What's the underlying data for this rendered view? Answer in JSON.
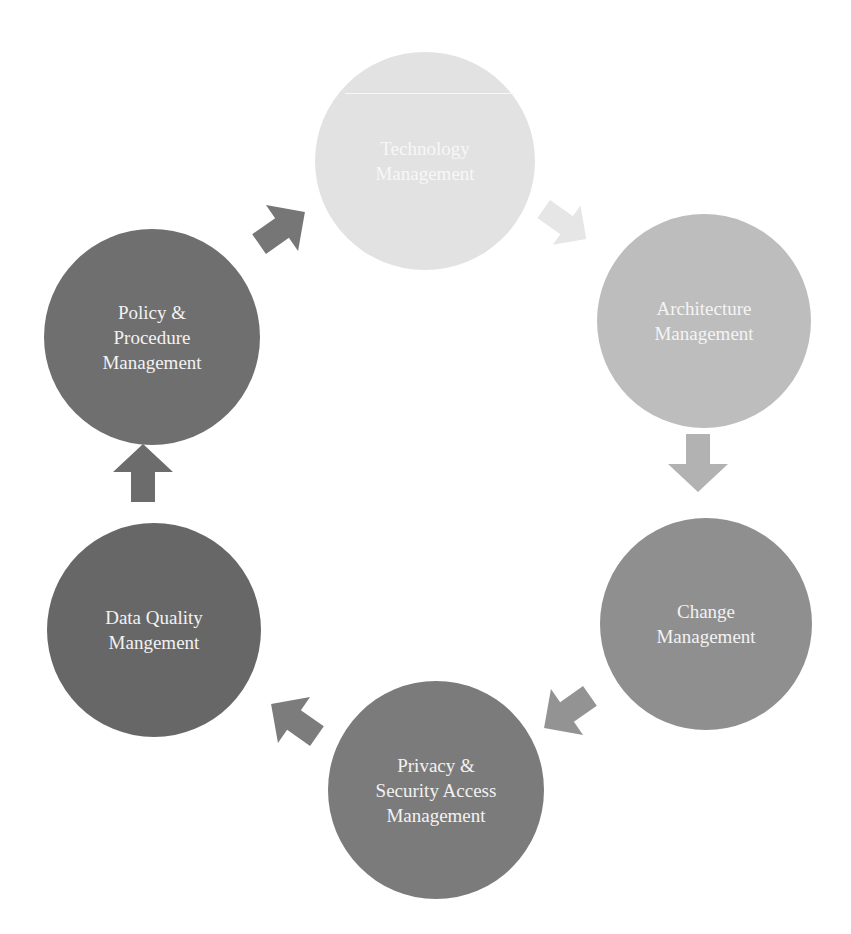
{
  "diagram": {
    "type": "cycle",
    "nodes": [
      {
        "id": "technology",
        "label": "Technology\nManagement",
        "color": "#e2e2e2",
        "text_color": "#f7f7f7"
      },
      {
        "id": "architecture",
        "label": "Architecture\nManagement",
        "color": "#bdbdbd",
        "text_color": "#f4f4f4"
      },
      {
        "id": "change",
        "label": "Change\nManagement",
        "color": "#8f8f8f",
        "text_color": "#efefef"
      },
      {
        "id": "privacy",
        "label": "Privacy &\nSecurity Access\nManagement",
        "color": "#7b7b7b",
        "text_color": "#efefef"
      },
      {
        "id": "data-quality",
        "label": "Data Quality\nMangement",
        "color": "#676767",
        "text_color": "#efefef"
      },
      {
        "id": "policy",
        "label": "Policy &\nProcedure\nManagement",
        "color": "#6f6f6f",
        "text_color": "#efefef"
      }
    ],
    "edges": [
      {
        "from": "technology",
        "to": "architecture",
        "color": "#e6e6e6"
      },
      {
        "from": "architecture",
        "to": "change",
        "color": "#b2b2b2"
      },
      {
        "from": "change",
        "to": "privacy",
        "color": "#939393"
      },
      {
        "from": "privacy",
        "to": "data-quality",
        "color": "#7c7c7c"
      },
      {
        "from": "data-quality",
        "to": "policy",
        "color": "#6c6c6c"
      },
      {
        "from": "policy",
        "to": "technology",
        "color": "#767676"
      }
    ]
  }
}
